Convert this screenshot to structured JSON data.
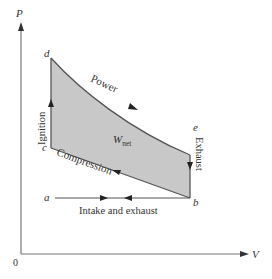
{
  "diagram": {
    "axes": {
      "y_label": "P",
      "x_label": "V",
      "origin_label": "0"
    },
    "points": {
      "a": "a",
      "b": "b",
      "c": "c",
      "d": "d",
      "e": "e"
    },
    "processes": {
      "power": "Power",
      "compression": "Compression",
      "ignition": "Ignition",
      "exhaust": "Exhaust",
      "intake_exhaust": "Intake and exhaust"
    },
    "net_work": {
      "symbol": "W",
      "subscript": "net"
    },
    "colors": {
      "fill": "#c8c8c8",
      "line": "#555555",
      "text": "#333333"
    }
  }
}
